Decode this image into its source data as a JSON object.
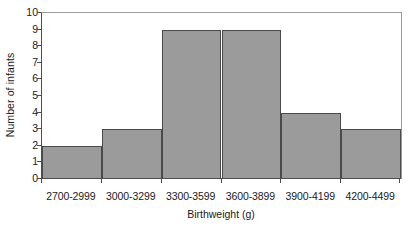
{
  "chart_data": {
    "type": "bar",
    "title": "",
    "subtitle": "",
    "xlabel": "Birthweight (g)",
    "ylabel": "Number of infants",
    "categories": [
      "2700-2999",
      "3000-3299",
      "3300-3599",
      "3600-3899",
      "3900-4199",
      "4200-4499"
    ],
    "values": [
      2,
      3,
      9,
      9,
      4,
      3
    ],
    "ylim": [
      0,
      10
    ],
    "yticks": [
      0,
      1,
      2,
      3,
      4,
      5,
      6,
      7,
      8,
      9,
      10
    ],
    "ytick_labels": [
      "0",
      "1",
      "2",
      "3",
      "4",
      "5",
      "6",
      "7",
      "8",
      "9",
      "10"
    ],
    "grid": false,
    "legend": false,
    "legend_position": "none",
    "bar_gap": 0,
    "colors": {
      "bar_fill": "#9b9b9b",
      "bar_edge": "#4a4a4a",
      "axis": "#4d4d4d",
      "frame": "#9a9a9a",
      "text": "#1a1a1a",
      "background": "#ffffff"
    }
  },
  "caption": {
    "remnant": ""
  }
}
